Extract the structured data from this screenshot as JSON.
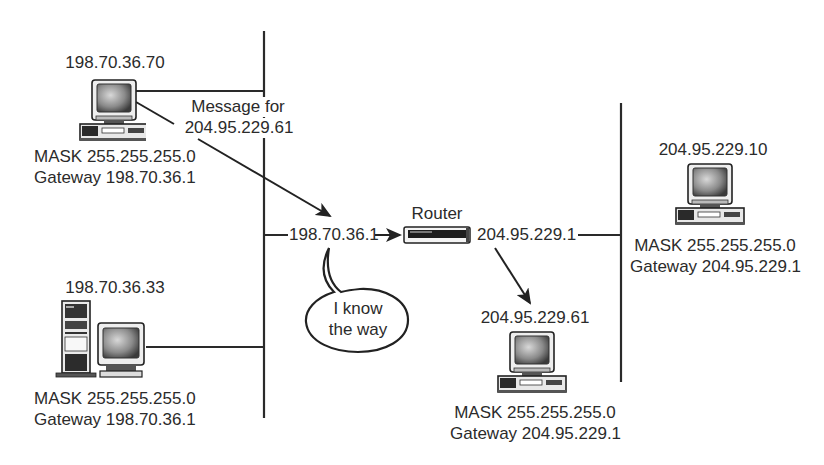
{
  "diagram": {
    "type": "network-routing",
    "left_network": {
      "hosts": [
        {
          "id": "host-a",
          "ip": "198.70.36.70",
          "mask": "MASK 255.255.255.0",
          "gateway": "Gateway 198.70.36.1",
          "device": "desktop-computer"
        },
        {
          "id": "host-b",
          "ip": "198.70.36.33",
          "mask": "MASK 255.255.255.0",
          "gateway": "Gateway 198.70.36.1",
          "device": "tower-computer"
        }
      ]
    },
    "message": {
      "line1": "Message for",
      "line2": "204.95.229.61"
    },
    "router": {
      "label": "Router",
      "left_interface": "198.70.36.1",
      "right_interface": "204.95.229.1",
      "speech_line1": "I know",
      "speech_line2": "the way"
    },
    "right_network": {
      "hosts": [
        {
          "id": "host-c",
          "ip": "204.95.229.10",
          "mask": "MASK 255.255.255.0",
          "gateway": "Gateway 204.95.229.1",
          "device": "desktop-computer"
        },
        {
          "id": "host-d",
          "ip": "204.95.229.61",
          "mask": "MASK 255.255.255.0",
          "gateway": "Gateway 204.95.229.1",
          "device": "desktop-computer"
        }
      ]
    },
    "colors": {
      "line": "#2a2a2a",
      "text": "#2b2b2b",
      "background": "#ffffff"
    }
  }
}
